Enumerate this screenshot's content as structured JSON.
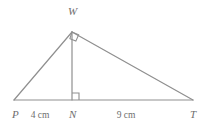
{
  "figure": {
    "kind": "triangle-with-altitude",
    "background_color": "#ffffff",
    "stroke_color": "#8f8f8f",
    "text_color": "#6e6e6e",
    "vertices": {
      "P": {
        "label": "P",
        "x": 14,
        "y": 100,
        "label_x": 12,
        "label_y": 118
      },
      "N": {
        "label": "N",
        "x": 72,
        "y": 100,
        "label_x": 69,
        "label_y": 118
      },
      "T": {
        "label": "T",
        "x": 193,
        "y": 100,
        "label_x": 190,
        "label_y": 118
      },
      "W": {
        "label": "W",
        "x": 72,
        "y": 32,
        "label_x": 68,
        "label_y": 15
      }
    },
    "segments": [
      {
        "name": "side-PW",
        "from": "P",
        "to": "W"
      },
      {
        "name": "side-WT",
        "from": "W",
        "to": "T"
      },
      {
        "name": "base-PT",
        "from": "P",
        "to": "T"
      },
      {
        "name": "altitude-WN",
        "from": "W",
        "to": "N"
      }
    ],
    "measurements": [
      {
        "name": "segment-PN-length",
        "text": "4 cm",
        "x": 40,
        "y": 118
      },
      {
        "name": "segment-NT-length",
        "text": "9 cm",
        "x": 126,
        "y": 118
      }
    ],
    "right_angle_marks": [
      {
        "name": "right-angle-at-N",
        "at": "N",
        "style": "square",
        "size": 7
      },
      {
        "name": "right-angle-at-W",
        "at": "W",
        "style": "diamond",
        "size": 7
      }
    ]
  }
}
